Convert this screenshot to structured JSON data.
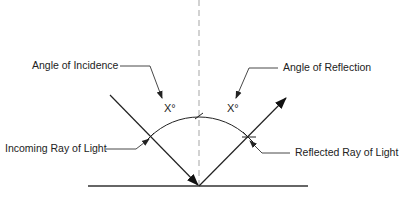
{
  "diagram": {
    "labels": {
      "angle_of_incidence": "Angle of Incidence",
      "angle_of_reflection": "Angle of Reflection",
      "incoming_ray": "Incoming Ray of Light",
      "reflected_ray": "Reflected Ray of Light",
      "incidence_angle_value": "X°",
      "reflection_angle_value": "X°"
    },
    "colors": {
      "line": "#222222",
      "normal": "#aaaaaa",
      "background": "#ffffff"
    }
  }
}
